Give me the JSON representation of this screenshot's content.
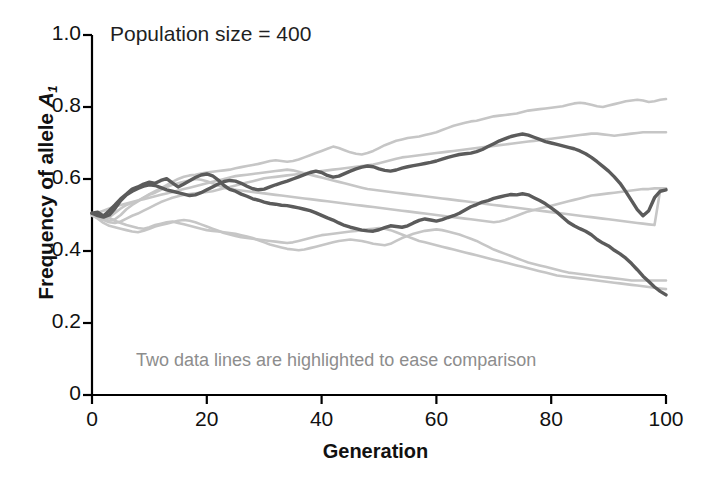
{
  "chart_data": {
    "type": "line",
    "title": "",
    "annotation_top": "Population size = 400",
    "annotation_bottom": "Two data lines are highlighted to ease comparison",
    "xlabel": "Generation",
    "ylabel_prefix": "Frequency of allele ",
    "ylabel_symbol": "A",
    "ylabel_subscript": "1",
    "xlim": [
      0,
      100
    ],
    "ylim": [
      0,
      1.0
    ],
    "xticks": [
      0,
      20,
      40,
      60,
      80,
      100
    ],
    "xtick_labels": [
      "0",
      "20",
      "40",
      "60",
      "80",
      "100"
    ],
    "yticks": [
      0,
      0.2,
      0.4,
      0.6,
      0.8,
      1.0
    ],
    "ytick_labels": [
      "0",
      "0.2",
      "0.4",
      "0.6",
      "0.8",
      "1.0"
    ],
    "grid": false,
    "legend": "none",
    "population_size": 400,
    "highlight_color": "#5b5b5b",
    "background_color": "#c6c6c6",
    "axis_color": "#000000",
    "x": [
      0,
      1,
      2,
      3,
      4,
      5,
      6,
      7,
      8,
      9,
      10,
      11,
      12,
      13,
      14,
      15,
      16,
      17,
      18,
      19,
      20,
      21,
      22,
      23,
      24,
      25,
      26,
      27,
      28,
      29,
      30,
      31,
      32,
      33,
      34,
      35,
      36,
      37,
      38,
      39,
      40,
      41,
      42,
      43,
      44,
      45,
      46,
      47,
      48,
      49,
      50,
      51,
      52,
      53,
      54,
      55,
      56,
      57,
      58,
      59,
      60,
      61,
      62,
      63,
      64,
      65,
      66,
      67,
      68,
      69,
      70,
      71,
      72,
      73,
      74,
      75,
      76,
      77,
      78,
      79,
      80,
      81,
      82,
      83,
      84,
      85,
      86,
      87,
      88,
      89,
      90,
      91,
      92,
      93,
      94,
      95,
      96,
      97,
      98,
      99,
      100
    ],
    "series": [
      {
        "name": "replicate-1",
        "highlighted": true,
        "color": "#5b5b5b",
        "values": [
          0.505,
          0.508,
          0.497,
          0.512,
          0.528,
          0.545,
          0.558,
          0.572,
          0.578,
          0.586,
          0.591,
          0.588,
          0.596,
          0.601,
          0.589,
          0.578,
          0.586,
          0.595,
          0.604,
          0.611,
          0.614,
          0.609,
          0.597,
          0.582,
          0.571,
          0.566,
          0.558,
          0.552,
          0.545,
          0.541,
          0.536,
          0.532,
          0.53,
          0.527,
          0.526,
          0.523,
          0.52,
          0.516,
          0.512,
          0.506,
          0.499,
          0.492,
          0.486,
          0.478,
          0.471,
          0.466,
          0.462,
          0.458,
          0.456,
          0.455,
          0.459,
          0.465,
          0.47,
          0.468,
          0.466,
          0.47,
          0.478,
          0.485,
          0.489,
          0.486,
          0.483,
          0.487,
          0.493,
          0.498,
          0.505,
          0.514,
          0.523,
          0.529,
          0.536,
          0.54,
          0.546,
          0.55,
          0.554,
          0.557,
          0.556,
          0.559,
          0.556,
          0.548,
          0.54,
          0.531,
          0.52,
          0.508,
          0.494,
          0.48,
          0.47,
          0.462,
          0.455,
          0.445,
          0.432,
          0.422,
          0.414,
          0.402,
          0.392,
          0.38,
          0.365,
          0.348,
          0.33,
          0.315,
          0.3,
          0.288,
          0.278
        ]
      },
      {
        "name": "replicate-2",
        "highlighted": true,
        "color": "#5b5b5b",
        "values": [
          0.505,
          0.498,
          0.494,
          0.5,
          0.518,
          0.54,
          0.556,
          0.566,
          0.574,
          0.58,
          0.584,
          0.582,
          0.576,
          0.57,
          0.566,
          0.562,
          0.558,
          0.554,
          0.556,
          0.562,
          0.57,
          0.578,
          0.586,
          0.593,
          0.596,
          0.594,
          0.588,
          0.58,
          0.573,
          0.57,
          0.572,
          0.578,
          0.584,
          0.589,
          0.594,
          0.6,
          0.606,
          0.612,
          0.618,
          0.622,
          0.618,
          0.61,
          0.605,
          0.608,
          0.615,
          0.622,
          0.628,
          0.633,
          0.636,
          0.634,
          0.628,
          0.624,
          0.622,
          0.625,
          0.63,
          0.634,
          0.637,
          0.64,
          0.643,
          0.646,
          0.65,
          0.655,
          0.66,
          0.664,
          0.668,
          0.67,
          0.672,
          0.676,
          0.682,
          0.69,
          0.698,
          0.706,
          0.712,
          0.718,
          0.722,
          0.725,
          0.722,
          0.716,
          0.71,
          0.704,
          0.7,
          0.696,
          0.692,
          0.688,
          0.684,
          0.678,
          0.67,
          0.66,
          0.648,
          0.635,
          0.622,
          0.606,
          0.588,
          0.565,
          0.54,
          0.515,
          0.498,
          0.512,
          0.548,
          0.566,
          0.57
        ]
      },
      {
        "name": "replicate-3",
        "highlighted": false,
        "color": "#c6c6c6",
        "values": [
          0.502,
          0.496,
          0.49,
          0.484,
          0.488,
          0.5,
          0.516,
          0.528,
          0.538,
          0.548,
          0.558,
          0.566,
          0.574,
          0.583,
          0.592,
          0.6,
          0.606,
          0.61,
          0.612,
          0.615,
          0.618,
          0.62,
          0.622,
          0.624,
          0.626,
          0.63,
          0.633,
          0.636,
          0.639,
          0.642,
          0.646,
          0.65,
          0.652,
          0.65,
          0.648,
          0.65,
          0.654,
          0.66,
          0.666,
          0.672,
          0.678,
          0.684,
          0.69,
          0.686,
          0.68,
          0.674,
          0.67,
          0.668,
          0.672,
          0.678,
          0.686,
          0.694,
          0.7,
          0.706,
          0.71,
          0.714,
          0.716,
          0.718,
          0.722,
          0.726,
          0.73,
          0.736,
          0.742,
          0.748,
          0.752,
          0.756,
          0.76,
          0.762,
          0.766,
          0.77,
          0.774,
          0.776,
          0.778,
          0.78,
          0.782,
          0.786,
          0.79,
          0.792,
          0.794,
          0.796,
          0.798,
          0.8,
          0.802,
          0.806,
          0.81,
          0.812,
          0.81,
          0.806,
          0.802,
          0.8,
          0.804,
          0.808,
          0.812,
          0.816,
          0.818,
          0.82,
          0.818,
          0.814,
          0.816,
          0.82,
          0.822
        ]
      },
      {
        "name": "replicate-4",
        "highlighted": false,
        "color": "#c6c6c6",
        "values": [
          0.5,
          0.494,
          0.486,
          0.48,
          0.478,
          0.482,
          0.49,
          0.498,
          0.504,
          0.512,
          0.52,
          0.528,
          0.536,
          0.542,
          0.548,
          0.552,
          0.556,
          0.558,
          0.56,
          0.562,
          0.564,
          0.566,
          0.57,
          0.574,
          0.578,
          0.582,
          0.586,
          0.59,
          0.594,
          0.598,
          0.602,
          0.604,
          0.606,
          0.608,
          0.61,
          0.612,
          0.614,
          0.616,
          0.618,
          0.62,
          0.622,
          0.624,
          0.626,
          0.628,
          0.63,
          0.632,
          0.634,
          0.636,
          0.638,
          0.64,
          0.644,
          0.648,
          0.652,
          0.656,
          0.66,
          0.662,
          0.664,
          0.666,
          0.668,
          0.67,
          0.672,
          0.674,
          0.676,
          0.678,
          0.68,
          0.682,
          0.684,
          0.686,
          0.688,
          0.69,
          0.692,
          0.694,
          0.696,
          0.698,
          0.7,
          0.702,
          0.704,
          0.706,
          0.708,
          0.71,
          0.712,
          0.714,
          0.716,
          0.718,
          0.72,
          0.722,
          0.724,
          0.726,
          0.726,
          0.724,
          0.722,
          0.72,
          0.722,
          0.724,
          0.726,
          0.728,
          0.73,
          0.73,
          0.73,
          0.73,
          0.73
        ]
      },
      {
        "name": "replicate-5",
        "highlighted": false,
        "color": "#c6c6c6",
        "values": [
          0.498,
          0.492,
          0.488,
          0.494,
          0.506,
          0.518,
          0.528,
          0.534,
          0.54,
          0.548,
          0.556,
          0.562,
          0.57,
          0.578,
          0.584,
          0.588,
          0.592,
          0.596,
          0.6,
          0.598,
          0.594,
          0.588,
          0.582,
          0.576,
          0.572,
          0.57,
          0.568,
          0.566,
          0.564,
          0.562,
          0.56,
          0.558,
          0.556,
          0.554,
          0.552,
          0.55,
          0.548,
          0.546,
          0.544,
          0.542,
          0.54,
          0.538,
          0.536,
          0.534,
          0.532,
          0.53,
          0.528,
          0.526,
          0.524,
          0.522,
          0.52,
          0.518,
          0.516,
          0.514,
          0.512,
          0.51,
          0.508,
          0.506,
          0.504,
          0.502,
          0.5,
          0.498,
          0.496,
          0.494,
          0.492,
          0.49,
          0.488,
          0.486,
          0.484,
          0.482,
          0.48,
          0.482,
          0.486,
          0.492,
          0.498,
          0.504,
          0.51,
          0.514,
          0.518,
          0.522,
          0.526,
          0.53,
          0.534,
          0.538,
          0.542,
          0.546,
          0.55,
          0.554,
          0.556,
          0.558,
          0.56,
          0.562,
          0.564,
          0.566,
          0.568,
          0.57,
          0.572,
          0.572,
          0.574,
          0.574,
          0.574
        ]
      },
      {
        "name": "replicate-6",
        "highlighted": false,
        "color": "#c6c6c6",
        "values": [
          0.5,
          0.49,
          0.478,
          0.47,
          0.466,
          0.462,
          0.458,
          0.454,
          0.452,
          0.456,
          0.462,
          0.468,
          0.472,
          0.476,
          0.48,
          0.484,
          0.486,
          0.484,
          0.48,
          0.474,
          0.468,
          0.462,
          0.456,
          0.45,
          0.446,
          0.442,
          0.438,
          0.436,
          0.434,
          0.432,
          0.43,
          0.428,
          0.426,
          0.424,
          0.422,
          0.424,
          0.428,
          0.432,
          0.436,
          0.44,
          0.444,
          0.446,
          0.448,
          0.45,
          0.452,
          0.454,
          0.456,
          0.458,
          0.46,
          0.462,
          0.464,
          0.462,
          0.458,
          0.452,
          0.446,
          0.44,
          0.434,
          0.428,
          0.424,
          0.42,
          0.416,
          0.412,
          0.408,
          0.404,
          0.4,
          0.396,
          0.392,
          0.388,
          0.384,
          0.38,
          0.376,
          0.372,
          0.368,
          0.364,
          0.36,
          0.356,
          0.352,
          0.348,
          0.344,
          0.34,
          0.336,
          0.332,
          0.33,
          0.328,
          0.326,
          0.324,
          0.322,
          0.32,
          0.318,
          0.316,
          0.314,
          0.312,
          0.31,
          0.308,
          0.306,
          0.304,
          0.302,
          0.3,
          0.298,
          0.296,
          0.294
        ]
      },
      {
        "name": "replicate-7",
        "highlighted": false,
        "color": "#c6c6c6",
        "values": [
          0.502,
          0.506,
          0.512,
          0.518,
          0.524,
          0.528,
          0.532,
          0.536,
          0.54,
          0.544,
          0.548,
          0.552,
          0.556,
          0.56,
          0.564,
          0.568,
          0.572,
          0.576,
          0.58,
          0.584,
          0.588,
          0.592,
          0.596,
          0.6,
          0.604,
          0.608,
          0.61,
          0.612,
          0.614,
          0.616,
          0.618,
          0.62,
          0.622,
          0.624,
          0.626,
          0.624,
          0.62,
          0.616,
          0.612,
          0.608,
          0.604,
          0.6,
          0.596,
          0.592,
          0.588,
          0.584,
          0.58,
          0.576,
          0.572,
          0.57,
          0.568,
          0.566,
          0.564,
          0.562,
          0.56,
          0.558,
          0.556,
          0.554,
          0.552,
          0.55,
          0.548,
          0.546,
          0.544,
          0.542,
          0.54,
          0.538,
          0.536,
          0.534,
          0.532,
          0.53,
          0.528,
          0.526,
          0.524,
          0.522,
          0.52,
          0.518,
          0.516,
          0.514,
          0.512,
          0.51,
          0.508,
          0.506,
          0.504,
          0.502,
          0.5,
          0.498,
          0.496,
          0.494,
          0.492,
          0.49,
          0.488,
          0.486,
          0.484,
          0.482,
          0.48,
          0.478,
          0.476,
          0.474,
          0.472,
          0.57,
          0.572
        ]
      },
      {
        "name": "replicate-8",
        "highlighted": false,
        "color": "#c6c6c6",
        "values": [
          0.5,
          0.504,
          0.5,
          0.492,
          0.484,
          0.478,
          0.472,
          0.468,
          0.464,
          0.462,
          0.466,
          0.472,
          0.476,
          0.48,
          0.482,
          0.478,
          0.474,
          0.47,
          0.466,
          0.462,
          0.458,
          0.456,
          0.454,
          0.452,
          0.45,
          0.448,
          0.444,
          0.44,
          0.436,
          0.43,
          0.424,
          0.418,
          0.414,
          0.41,
          0.406,
          0.404,
          0.402,
          0.404,
          0.408,
          0.412,
          0.416,
          0.42,
          0.424,
          0.428,
          0.43,
          0.432,
          0.43,
          0.428,
          0.424,
          0.42,
          0.418,
          0.416,
          0.42,
          0.428,
          0.436,
          0.442,
          0.448,
          0.452,
          0.456,
          0.458,
          0.46,
          0.458,
          0.454,
          0.45,
          0.446,
          0.44,
          0.434,
          0.428,
          0.42,
          0.412,
          0.404,
          0.398,
          0.392,
          0.386,
          0.38,
          0.374,
          0.368,
          0.364,
          0.36,
          0.356,
          0.352,
          0.348,
          0.344,
          0.34,
          0.338,
          0.336,
          0.334,
          0.332,
          0.33,
          0.328,
          0.326,
          0.324,
          0.322,
          0.32,
          0.318,
          0.318,
          0.318,
          0.318,
          0.318,
          0.318,
          0.318
        ]
      }
    ]
  }
}
